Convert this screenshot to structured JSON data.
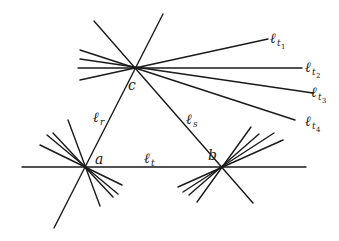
{
  "diagram": {
    "points": {
      "a": {
        "label": "a",
        "x": 85,
        "y": 167
      },
      "b": {
        "label": "b",
        "x": 221,
        "y": 168
      },
      "c": {
        "label": "c",
        "x": 135,
        "y": 68
      }
    },
    "line_labels": {
      "r": {
        "main": "ℓ",
        "sub": "r"
      },
      "s": {
        "main": "ℓ",
        "sub": "s"
      },
      "t": {
        "main": "ℓ",
        "sub": "t"
      },
      "t1": {
        "main": "ℓ",
        "sub": "t",
        "subsub": "1"
      },
      "t2": {
        "main": "ℓ",
        "sub": "t",
        "subsub": "2"
      },
      "t3": {
        "main": "ℓ",
        "sub": "t",
        "subsub": "3"
      },
      "t4": {
        "main": "ℓ",
        "sub": "t",
        "subsub": "4"
      }
    },
    "colors": {
      "line": "#1a1a1a",
      "background": "#ffffff"
    }
  }
}
